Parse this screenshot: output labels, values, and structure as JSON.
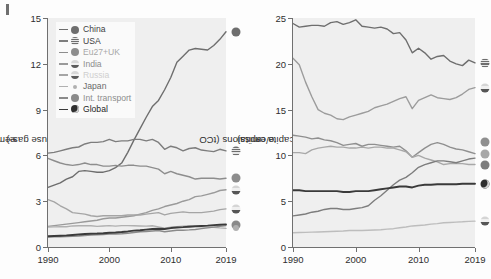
{
  "figure": {
    "panel_label": "f",
    "background": "#efefef"
  },
  "chart_data": [
    {
      "type": "line",
      "panel": "left",
      "title": "",
      "xlabel": "",
      "ylabel": "Greenhouse gas emissions (GtCO₂e)",
      "ylabel_main": "Greenhouse gas emissions (GtCO",
      "ylabel_sub": "2",
      "ylabel_tail": "e)",
      "xlim": [
        1990,
        2019
      ],
      "ylim": [
        0,
        15
      ],
      "xticks": [
        1990,
        2000,
        2010,
        2019
      ],
      "yticks": [
        0,
        3,
        6,
        9,
        12,
        15
      ],
      "grid": false,
      "legend_position": "upper-left",
      "x": [
        1990,
        1991,
        1992,
        1993,
        1994,
        1995,
        1996,
        1997,
        1998,
        1999,
        2000,
        2001,
        2002,
        2003,
        2004,
        2005,
        2006,
        2007,
        2008,
        2009,
        2010,
        2011,
        2012,
        2013,
        2014,
        2015,
        2016,
        2017,
        2018,
        2019
      ],
      "series": [
        {
          "name": "China",
          "color": "#6e6e6e",
          "values": [
            3.9,
            4.05,
            4.2,
            4.45,
            4.6,
            4.95,
            5.0,
            4.95,
            4.9,
            4.9,
            5.0,
            5.2,
            5.5,
            6.2,
            7.0,
            7.75,
            8.5,
            9.2,
            9.6,
            10.3,
            11.1,
            12.1,
            12.5,
            12.9,
            13.0,
            12.95,
            12.9,
            13.2,
            13.6,
            14.1
          ]
        },
        {
          "name": "USA",
          "color": "#7d7d7d",
          "values": [
            6.15,
            6.2,
            6.3,
            6.4,
            6.5,
            6.55,
            6.75,
            6.85,
            6.85,
            6.9,
            7.05,
            6.9,
            6.95,
            6.95,
            7.05,
            7.05,
            6.95,
            7.05,
            6.85,
            6.4,
            6.6,
            6.5,
            6.3,
            6.45,
            6.5,
            6.35,
            6.3,
            6.25,
            6.4,
            6.3
          ]
        },
        {
          "name": "Eu27+UK",
          "color": "#8d8d8d",
          "values": [
            5.8,
            5.65,
            5.5,
            5.4,
            5.35,
            5.4,
            5.5,
            5.4,
            5.4,
            5.3,
            5.3,
            5.35,
            5.3,
            5.35,
            5.35,
            5.3,
            5.3,
            5.2,
            5.1,
            4.8,
            4.95,
            4.8,
            4.7,
            4.6,
            4.45,
            4.5,
            4.5,
            4.5,
            4.45,
            4.5
          ]
        },
        {
          "name": "India",
          "color": "#9a9a9a",
          "values": [
            1.35,
            1.4,
            1.45,
            1.5,
            1.55,
            1.6,
            1.65,
            1.7,
            1.75,
            1.85,
            1.9,
            1.9,
            1.95,
            2.0,
            2.05,
            2.15,
            2.25,
            2.4,
            2.5,
            2.65,
            2.75,
            2.85,
            3.0,
            3.1,
            3.3,
            3.35,
            3.45,
            3.55,
            3.7,
            3.75
          ]
        },
        {
          "name": "Russia",
          "color": "#a5a5a5",
          "values": [
            3.1,
            2.95,
            2.7,
            2.5,
            2.25,
            2.2,
            2.15,
            2.05,
            2.0,
            2.05,
            2.05,
            2.05,
            2.05,
            2.1,
            2.1,
            2.1,
            2.15,
            2.2,
            2.25,
            2.1,
            2.2,
            2.25,
            2.3,
            2.25,
            2.25,
            2.25,
            2.3,
            2.35,
            2.45,
            2.5
          ]
        },
        {
          "name": "Japan",
          "color": "#b0b0b0",
          "values": [
            1.3,
            1.32,
            1.33,
            1.33,
            1.38,
            1.39,
            1.4,
            1.39,
            1.35,
            1.38,
            1.4,
            1.37,
            1.4,
            1.4,
            1.39,
            1.38,
            1.37,
            1.39,
            1.32,
            1.24,
            1.3,
            1.33,
            1.37,
            1.39,
            1.35,
            1.32,
            1.3,
            1.29,
            1.25,
            1.22
          ]
        },
        {
          "name": "Int. transport",
          "color": "#8a8a8a",
          "values": [
            0.65,
            0.66,
            0.67,
            0.68,
            0.7,
            0.72,
            0.75,
            0.78,
            0.8,
            0.82,
            0.85,
            0.85,
            0.87,
            0.9,
            0.95,
            1.0,
            1.02,
            1.05,
            1.08,
            1.0,
            1.05,
            1.1,
            1.1,
            1.12,
            1.15,
            1.2,
            1.25,
            1.3,
            1.35,
            1.4
          ]
        },
        {
          "name": "Global",
          "color": "#3a3a3a",
          "values": [
            0.7,
            0.72,
            0.74,
            0.76,
            0.79,
            0.82,
            0.85,
            0.87,
            0.88,
            0.9,
            0.93,
            0.95,
            0.98,
            1.02,
            1.07,
            1.1,
            1.14,
            1.18,
            1.2,
            1.18,
            1.24,
            1.28,
            1.3,
            1.33,
            1.36,
            1.38,
            1.4,
            1.43,
            1.46,
            1.48
          ]
        }
      ],
      "endpoint_markers": [
        {
          "name": "China",
          "value": 14.1
        },
        {
          "name": "USA",
          "value": 6.3
        },
        {
          "name": "Eu27+UK",
          "value": 4.5
        },
        {
          "name": "India",
          "value": 3.75
        },
        {
          "name": "Russia",
          "value": 2.5
        },
        {
          "name": "Int. transport",
          "value": 1.45
        },
        {
          "name": "Japan",
          "value": 1.22
        }
      ]
    },
    {
      "type": "line",
      "panel": "right",
      "title": "",
      "xlabel": "",
      "ylabel": "Per capita emissions (tCO₂e/capita)",
      "ylabel_main": "Per capita emissions (tCO",
      "ylabel_sub": "2",
      "ylabel_tail": "e/capita)",
      "xlim": [
        1990,
        2019
      ],
      "ylim": [
        0,
        25
      ],
      "xticks": [
        1990,
        2000,
        2010,
        2019
      ],
      "yticks": [
        0,
        5,
        10,
        15,
        20,
        25
      ],
      "grid": false,
      "legend_position": "none",
      "x": [
        1990,
        1991,
        1992,
        1993,
        1994,
        1995,
        1996,
        1997,
        1998,
        1999,
        2000,
        2001,
        2002,
        2003,
        2004,
        2005,
        2006,
        2007,
        2008,
        2009,
        2010,
        2011,
        2012,
        2013,
        2014,
        2015,
        2016,
        2017,
        2018,
        2019
      ],
      "series": [
        {
          "name": "USA",
          "color": "#6e6e6e",
          "values": [
            24.4,
            24.0,
            24.1,
            24.2,
            24.2,
            24.1,
            24.5,
            24.6,
            24.3,
            24.5,
            24.8,
            24.1,
            24.0,
            23.9,
            24.0,
            23.8,
            23.3,
            23.4,
            22.6,
            21.2,
            21.7,
            21.2,
            20.5,
            20.8,
            20.9,
            20.3,
            20.0,
            19.8,
            20.4,
            20.1
          ]
        },
        {
          "name": "Russia",
          "color": "#9c9c9c",
          "values": [
            20.6,
            19.9,
            18.0,
            16.4,
            15.0,
            14.6,
            14.4,
            14.0,
            13.9,
            14.2,
            14.4,
            14.6,
            14.8,
            15.2,
            15.4,
            15.6,
            15.9,
            16.2,
            16.4,
            15.1,
            16.0,
            16.3,
            16.6,
            16.3,
            16.2,
            16.1,
            16.3,
            16.7,
            17.2,
            17.4
          ]
        },
        {
          "name": "Japan",
          "color": "#8f8f8f",
          "values": [
            12.2,
            12.1,
            12.0,
            11.8,
            11.9,
            11.7,
            11.6,
            11.4,
            11.1,
            11.2,
            11.3,
            11.0,
            11.2,
            11.2,
            11.1,
            11.0,
            10.9,
            11.0,
            10.5,
            9.8,
            10.3,
            10.8,
            11.2,
            11.4,
            11.2,
            10.9,
            10.7,
            10.6,
            10.4,
            10.2
          ]
        },
        {
          "name": "Eu27+UK",
          "color": "#a8a8a8",
          "values": [
            10.3,
            10.3,
            10.2,
            10.6,
            10.8,
            10.9,
            11.0,
            10.9,
            10.9,
            10.8,
            10.8,
            10.9,
            10.8,
            10.9,
            10.9,
            10.8,
            10.8,
            10.6,
            10.4,
            9.8,
            10.0,
            9.7,
            9.5,
            9.3,
            9.0,
            9.1,
            9.1,
            9.1,
            9.0,
            9.0
          ]
        },
        {
          "name": "China",
          "color": "#7d7d7d",
          "values": [
            3.4,
            3.5,
            3.6,
            3.8,
            3.9,
            4.1,
            4.2,
            4.2,
            4.1,
            4.1,
            4.2,
            4.3,
            4.5,
            5.1,
            5.6,
            6.2,
            6.8,
            7.3,
            7.6,
            8.1,
            8.7,
            9.0,
            9.2,
            9.4,
            9.4,
            9.3,
            9.2,
            9.4,
            9.6,
            9.7
          ]
        },
        {
          "name": "Global",
          "color": "#3a3a3a",
          "values": [
            6.2,
            6.2,
            6.1,
            6.1,
            6.1,
            6.1,
            6.1,
            6.1,
            6.0,
            6.0,
            6.1,
            6.1,
            6.1,
            6.2,
            6.3,
            6.4,
            6.5,
            6.6,
            6.6,
            6.5,
            6.7,
            6.8,
            6.8,
            6.85,
            6.85,
            6.85,
            6.85,
            6.9,
            6.9,
            6.9
          ]
        },
        {
          "name": "India",
          "color": "#bdbdbd",
          "values": [
            1.55,
            1.58,
            1.6,
            1.62,
            1.64,
            1.67,
            1.7,
            1.72,
            1.75,
            1.8,
            1.82,
            1.8,
            1.83,
            1.85,
            1.88,
            1.95,
            2.0,
            2.1,
            2.18,
            2.3,
            2.35,
            2.4,
            2.5,
            2.55,
            2.65,
            2.68,
            2.72,
            2.75,
            2.8,
            2.82
          ]
        }
      ],
      "endpoint_markers": [
        {
          "name": "USA",
          "value": 20.1
        },
        {
          "name": "Russia",
          "value": 17.4
        },
        {
          "name": "Japan",
          "value": 11.5
        },
        {
          "name": "Eu27+UK",
          "value": 10.2
        },
        {
          "name": "China",
          "value": 9.0
        },
        {
          "name": "Global",
          "value": 6.9
        },
        {
          "name": "India",
          "value": 2.82
        }
      ]
    }
  ],
  "legend": {
    "items": [
      {
        "label": "China",
        "color": "#6e6e6e",
        "marker": "china-flag-marker",
        "text_color": "#3f3f3f"
      },
      {
        "label": "USA",
        "color": "#7d7d7d",
        "marker": "usa-flag-marker",
        "text_color": "#3f3f3f"
      },
      {
        "label": "Eu27+UK",
        "color": "#8d8d8d",
        "marker": "eu-flag-marker",
        "text_color": "#a8a8a8"
      },
      {
        "label": "India",
        "color": "#9a9a9a",
        "marker": "india-flag-marker",
        "text_color": "#8d8d8d"
      },
      {
        "label": "Russia",
        "color": "#a5a5a5",
        "marker": "russia-flag-marker",
        "text_color": "#cfcfcf"
      },
      {
        "label": "Japan",
        "color": "#b0b0b0",
        "marker": "japan-flag-marker",
        "text_color": "#6a6a6a"
      },
      {
        "label": "Int. transport",
        "color": "#8a8a8a",
        "marker": "transport-marker",
        "text_color": "#8d8d8d"
      },
      {
        "label": "Global",
        "color": "#3a3a3a",
        "marker": "globe-marker",
        "text_color": "#1f1f1f"
      }
    ]
  },
  "axes": {
    "left": {
      "xticks": [
        "1990",
        "2000",
        "2010",
        "2019"
      ],
      "yticks": [
        "0",
        "3",
        "6",
        "9",
        "12",
        "15"
      ]
    },
    "right": {
      "xticks": [
        "1990",
        "2000",
        "2010",
        "2019"
      ],
      "yticks": [
        "0",
        "5",
        "10",
        "15",
        "20",
        "25"
      ]
    }
  }
}
